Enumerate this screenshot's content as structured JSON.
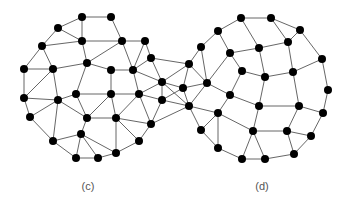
{
  "diagram": {
    "type": "graph",
    "node_color": "#000000",
    "edge_color": "#555555",
    "label_color": "#555555",
    "labels": [
      {
        "id": "label-c",
        "text": "(c)",
        "anchor": "c-center"
      },
      {
        "id": "label-d",
        "text": "(d)",
        "anchor": "d-center"
      }
    ],
    "nodes": {
      "A": [
        82,
        17
      ],
      "B": [
        111,
        17
      ],
      "C": [
        58,
        28
      ],
      "D": [
        82,
        41
      ],
      "E": [
        122,
        41
      ],
      "F": [
        145,
        41
      ],
      "G": [
        42,
        46
      ],
      "H": [
        151,
        58
      ],
      "I": [
        87,
        63
      ],
      "J": [
        24,
        69
      ],
      "K": [
        53,
        69
      ],
      "L": [
        111,
        70
      ],
      "M": [
        133,
        70
      ],
      "N": [
        162,
        82
      ],
      "O": [
        76,
        94
      ],
      "P": [
        111,
        94
      ],
      "Q": [
        139,
        94
      ],
      "R": [
        24,
        98
      ],
      "S": [
        58,
        100
      ],
      "T": [
        162,
        100
      ],
      "U": [
        30,
        117
      ],
      "V": [
        87,
        118
      ],
      "W": [
        116,
        118
      ],
      "X": [
        151,
        124
      ],
      "Y": [
        81,
        134
      ],
      "Z": [
        53,
        141
      ],
      "AA": [
        139,
        141
      ],
      "AB": [
        116,
        153
      ],
      "AC": [
        76,
        158
      ],
      "AD": [
        98,
        158
      ],
      "BA": [
        189,
        64
      ],
      "BB": [
        183,
        88
      ],
      "BC": [
        207,
        83
      ],
      "BD": [
        189,
        106
      ],
      "d1": [
        241,
        18
      ],
      "d2": [
        218,
        31
      ],
      "d3": [
        201,
        47
      ],
      "d4": [
        230,
        53
      ],
      "d5": [
        259,
        48
      ],
      "d6": [
        242,
        71
      ],
      "d7": [
        265,
        77
      ],
      "d8": [
        271,
        18
      ],
      "d9": [
        300,
        30
      ],
      "d10": [
        288,
        42
      ],
      "d11": [
        322,
        59
      ],
      "d12": [
        293,
        72
      ],
      "d13": [
        328,
        90
      ],
      "d14": [
        259,
        106
      ],
      "d15": [
        299,
        106
      ],
      "d16": [
        230,
        95
      ],
      "d17": [
        218,
        113
      ],
      "d18": [
        323,
        113
      ],
      "d19": [
        201,
        130
      ],
      "d20": [
        253,
        131
      ],
      "d21": [
        287,
        131
      ],
      "d22": [
        311,
        136
      ],
      "d23": [
        218,
        148
      ],
      "d24": [
        294,
        154
      ],
      "d25": [
        242,
        159
      ],
      "d26": [
        265,
        159
      ]
    },
    "edges": [
      [
        "C",
        "A"
      ],
      [
        "C",
        "D"
      ],
      [
        "A",
        "D"
      ],
      [
        "A",
        "B"
      ],
      [
        "G",
        "C"
      ],
      [
        "G",
        "D"
      ],
      [
        "G",
        "J"
      ],
      [
        "G",
        "K"
      ],
      [
        "D",
        "I"
      ],
      [
        "D",
        "E"
      ],
      [
        "I",
        "E"
      ],
      [
        "I",
        "K"
      ],
      [
        "I",
        "L"
      ],
      [
        "J",
        "K"
      ],
      [
        "B",
        "E"
      ],
      [
        "E",
        "F"
      ],
      [
        "E",
        "M"
      ],
      [
        "F",
        "M"
      ],
      [
        "F",
        "H"
      ],
      [
        "L",
        "M"
      ],
      [
        "L",
        "P"
      ],
      [
        "M",
        "Q"
      ],
      [
        "M",
        "N"
      ],
      [
        "H",
        "N"
      ],
      [
        "H",
        "M"
      ],
      [
        "J",
        "R"
      ],
      [
        "R",
        "K"
      ],
      [
        "K",
        "S"
      ],
      [
        "S",
        "O"
      ],
      [
        "O",
        "I"
      ],
      [
        "O",
        "P"
      ],
      [
        "P",
        "Q"
      ],
      [
        "Q",
        "N"
      ],
      [
        "Q",
        "T"
      ],
      [
        "T",
        "N"
      ],
      [
        "R",
        "S"
      ],
      [
        "R",
        "U"
      ],
      [
        "S",
        "U"
      ],
      [
        "S",
        "V"
      ],
      [
        "S",
        "Z"
      ],
      [
        "O",
        "V"
      ],
      [
        "V",
        "P"
      ],
      [
        "V",
        "W"
      ],
      [
        "W",
        "P"
      ],
      [
        "W",
        "Q"
      ],
      [
        "W",
        "X"
      ],
      [
        "Q",
        "X"
      ],
      [
        "X",
        "T"
      ],
      [
        "X",
        "AA"
      ],
      [
        "W",
        "AA"
      ],
      [
        "W",
        "AB"
      ],
      [
        "V",
        "Y"
      ],
      [
        "Y",
        "Z"
      ],
      [
        "Y",
        "AC"
      ],
      [
        "Y",
        "AD"
      ],
      [
        "Y",
        "AB"
      ],
      [
        "Z",
        "AC"
      ],
      [
        "AC",
        "AD"
      ],
      [
        "AD",
        "AB"
      ],
      [
        "AB",
        "AA"
      ],
      [
        "U",
        "Z"
      ],
      [
        "H",
        "BA"
      ],
      [
        "BA",
        "N"
      ],
      [
        "N",
        "BB"
      ],
      [
        "N",
        "BD"
      ],
      [
        "BB",
        "BD"
      ],
      [
        "T",
        "BB"
      ],
      [
        "T",
        "BD"
      ],
      [
        "BA",
        "BB"
      ],
      [
        "BA",
        "BC"
      ],
      [
        "BB",
        "BC"
      ],
      [
        "BD",
        "BC"
      ],
      [
        "BD",
        "d17"
      ],
      [
        "BD",
        "d19"
      ],
      [
        "X",
        "BD"
      ],
      [
        "d1",
        "d2"
      ],
      [
        "d2",
        "d3"
      ],
      [
        "d2",
        "d4"
      ],
      [
        "d3",
        "BA"
      ],
      [
        "d3",
        "BC"
      ],
      [
        "d4",
        "d5"
      ],
      [
        "d4",
        "BC"
      ],
      [
        "d4",
        "d6"
      ],
      [
        "d5",
        "d1"
      ],
      [
        "d5",
        "d10"
      ],
      [
        "d5",
        "d7"
      ],
      [
        "d6",
        "d7"
      ],
      [
        "d6",
        "d16"
      ],
      [
        "d1",
        "d8"
      ],
      [
        "d8",
        "d9"
      ],
      [
        "d8",
        "d10"
      ],
      [
        "d9",
        "d10"
      ],
      [
        "d10",
        "d12"
      ],
      [
        "d9",
        "d11"
      ],
      [
        "d11",
        "d12"
      ],
      [
        "d11",
        "d13"
      ],
      [
        "d12",
        "d7"
      ],
      [
        "d12",
        "d15"
      ],
      [
        "d7",
        "d14"
      ],
      [
        "d13",
        "d18"
      ],
      [
        "d15",
        "d14"
      ],
      [
        "d15",
        "d18"
      ],
      [
        "d15",
        "d21"
      ],
      [
        "d18",
        "d22"
      ],
      [
        "d21",
        "d22"
      ],
      [
        "d21",
        "d24"
      ],
      [
        "d22",
        "d24"
      ],
      [
        "d24",
        "d26"
      ],
      [
        "d20",
        "d21"
      ],
      [
        "d17",
        "d19"
      ],
      [
        "d17",
        "d16"
      ],
      [
        "d17",
        "d23"
      ],
      [
        "d17",
        "d20"
      ],
      [
        "d16",
        "d14"
      ],
      [
        "d16",
        "BC"
      ],
      [
        "d14",
        "d20"
      ],
      [
        "d20",
        "d25"
      ],
      [
        "d20",
        "d26"
      ],
      [
        "d23",
        "d25"
      ],
      [
        "d19",
        "d23"
      ],
      [
        "d25",
        "d26"
      ]
    ]
  }
}
